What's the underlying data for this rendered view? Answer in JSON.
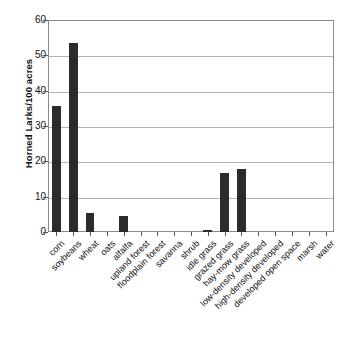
{
  "chart_data": {
    "type": "bar",
    "title": "",
    "subtitle": "",
    "xlabel": "",
    "ylabel": "Horned Larks/100 acres",
    "ylim": [
      0,
      60
    ],
    "yticks": [
      0,
      10,
      20,
      30,
      40,
      50,
      60
    ],
    "ytick_labels": [
      "0",
      "10",
      "20",
      "30",
      "40",
      "50",
      "60"
    ],
    "grid": "horizontal",
    "legend": "none",
    "bar_color": "#2b2b2b",
    "categories": [
      "corn",
      "soybeans",
      "wheat",
      "oats",
      "alfalfa",
      "upland forest",
      "floodplain forest",
      "savanna",
      "shrub",
      "idle grass",
      "grazed grass",
      "hay-mow grass",
      "low-density developed",
      "high-density developed",
      "developed open space",
      "marsh",
      "water"
    ],
    "values": [
      35.8,
      53.5,
      5.4,
      0,
      4.6,
      0,
      0,
      0,
      0,
      0.5,
      16.6,
      17.7,
      0,
      0,
      0,
      0,
      0
    ]
  }
}
